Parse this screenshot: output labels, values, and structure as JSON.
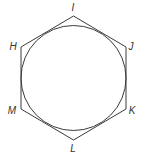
{
  "diagram": {
    "type": "geometry",
    "colors": {
      "stroke": "#3a3a3a",
      "label": "#333333",
      "background": "#ffffff"
    },
    "circle": {
      "cx": 73.5,
      "cy": 78,
      "r": 52.5
    },
    "vertices": [
      {
        "name": "I",
        "x": 73.5,
        "y": 16,
        "label_x": 73,
        "label_y": 11
      },
      {
        "name": "J",
        "x": 126,
        "y": 47,
        "label_x": 131,
        "label_y": 50
      },
      {
        "name": "K",
        "x": 126,
        "y": 109,
        "label_x": 132,
        "label_y": 114
      },
      {
        "name": "L",
        "x": 73.5,
        "y": 140,
        "label_x": 73,
        "label_y": 152
      },
      {
        "name": "M",
        "x": 21,
        "y": 109,
        "label_x": 12,
        "label_y": 114
      },
      {
        "name": "H",
        "x": 21,
        "y": 47,
        "label_x": 13,
        "label_y": 50
      }
    ],
    "labels": {
      "I": "I",
      "J": "J",
      "K": "K",
      "L": "L",
      "M": "M",
      "H": "H"
    }
  }
}
